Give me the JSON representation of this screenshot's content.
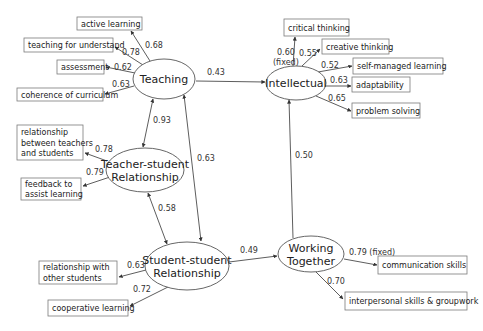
{
  "latent": [
    {
      "id": "teaching",
      "lines": [
        "Teaching"
      ],
      "cx": 164,
      "cy": 79,
      "rx": 31,
      "ry": 20
    },
    {
      "id": "intellectual",
      "lines": [
        "Intellectual"
      ],
      "cx": 296,
      "cy": 83,
      "rx": 30,
      "ry": 17
    },
    {
      "id": "teacher-student",
      "lines": [
        "Teacher-student",
        "Relationship"
      ],
      "cx": 145,
      "cy": 170,
      "rx": 39,
      "ry": 22
    },
    {
      "id": "student-student",
      "lines": [
        "Student-student",
        "Relationship"
      ],
      "cx": 187,
      "cy": 266,
      "rx": 42,
      "ry": 24
    },
    {
      "id": "working-together",
      "lines": [
        "Working",
        "Together"
      ],
      "cx": 311,
      "cy": 254,
      "rx": 33,
      "ry": 18
    }
  ],
  "indicators": [
    {
      "id": "active-learning",
      "lines": [
        "active learning"
      ],
      "x": 77,
      "y": 17,
      "w": 65,
      "h": 13
    },
    {
      "id": "teaching-for-understand",
      "lines": [
        "teaching for understand"
      ],
      "x": 24,
      "y": 38,
      "w": 89,
      "h": 14
    },
    {
      "id": "assessment",
      "lines": [
        "assessment"
      ],
      "x": 57,
      "y": 60,
      "w": 47,
      "h": 14
    },
    {
      "id": "coherence-of-curriculum",
      "lines": [
        "coherence of curriculum"
      ],
      "x": 17,
      "y": 88,
      "w": 86,
      "h": 13
    },
    {
      "id": "relationship-teachers-students",
      "lines": [
        "relationship",
        "between teachers",
        "and students"
      ],
      "x": 17,
      "y": 125,
      "w": 66,
      "h": 35
    },
    {
      "id": "feedback",
      "lines": [
        "feedback to",
        "assist learning"
      ],
      "x": 21,
      "y": 178,
      "w": 60,
      "h": 22
    },
    {
      "id": "relationship-other-students",
      "lines": [
        "relationship with",
        "other students"
      ],
      "x": 39,
      "y": 261,
      "w": 78,
      "h": 23
    },
    {
      "id": "cooperative-learning",
      "lines": [
        "cooperative learning"
      ],
      "x": 48,
      "y": 300,
      "w": 80,
      "h": 16
    },
    {
      "id": "critical-thinking",
      "lines": [
        "critical thinking"
      ],
      "x": 284,
      "y": 19,
      "w": 65,
      "h": 17
    },
    {
      "id": "creative-thinking",
      "lines": [
        "creative thinking"
      ],
      "x": 322,
      "y": 39,
      "w": 67,
      "h": 15
    },
    {
      "id": "self-managed-learning",
      "lines": [
        "self-managed learning"
      ],
      "x": 353,
      "y": 58,
      "w": 90,
      "h": 16
    },
    {
      "id": "adaptability",
      "lines": [
        "adaptability"
      ],
      "x": 352,
      "y": 77,
      "w": 58,
      "h": 15
    },
    {
      "id": "problem-solving",
      "lines": [
        "problem solving"
      ],
      "x": 352,
      "y": 103,
      "w": 68,
      "h": 15
    },
    {
      "id": "communication-skills",
      "lines": [
        "communication skills"
      ],
      "x": 378,
      "y": 256,
      "w": 89,
      "h": 18
    },
    {
      "id": "interpersonal-skills",
      "lines": [
        "interpersonal skills & groupwork"
      ],
      "x": 345,
      "y": 292,
      "w": 122,
      "h": 18
    }
  ],
  "paths": [
    {
      "id": "teaching-active",
      "x1": 150,
      "y1": 61,
      "x2": 131,
      "y2": 31,
      "dir": "end",
      "label": "0.68",
      "lx": 145,
      "ly": 48
    },
    {
      "id": "teaching-understand",
      "x1": 143,
      "y1": 65,
      "x2": 115,
      "y2": 47,
      "dir": "end",
      "label": "0.78",
      "lx": 122,
      "ly": 55
    },
    {
      "id": "teaching-assessment",
      "x1": 135,
      "y1": 73,
      "x2": 106,
      "y2": 67,
      "dir": "end",
      "label": "0.62",
      "lx": 114,
      "ly": 70
    },
    {
      "id": "teaching-coherence",
      "x1": 134,
      "y1": 86,
      "x2": 105,
      "y2": 94,
      "dir": "end",
      "label": "0.63",
      "lx": 112,
      "ly": 87
    },
    {
      "id": "teaching-intellectual",
      "x1": 196,
      "y1": 81,
      "x2": 265,
      "y2": 82,
      "dir": "end",
      "label": "0.43",
      "lx": 207,
      "ly": 75
    },
    {
      "id": "teaching-teacherstudent",
      "x1": 153,
      "y1": 99,
      "x2": 143,
      "y2": 147,
      "dir": "both",
      "label": "0.93",
      "lx": 153,
      "ly": 123
    },
    {
      "id": "teaching-studentstudent",
      "x1": 184,
      "y1": 95,
      "x2": 201,
      "y2": 241,
      "dir": "both",
      "label": "0.63",
      "lx": 197,
      "ly": 161
    },
    {
      "id": "teacherstudent-relationship",
      "x1": 107,
      "y1": 161,
      "x2": 85,
      "y2": 153,
      "dir": "end",
      "label": "0.78",
      "lx": 95,
      "ly": 152
    },
    {
      "id": "teacherstudent-feedback",
      "x1": 110,
      "y1": 177,
      "x2": 83,
      "y2": 186,
      "dir": "end",
      "label": "0.79",
      "lx": 86,
      "ly": 175
    },
    {
      "id": "teacherstudent-studentstudent",
      "x1": 148,
      "y1": 193,
      "x2": 167,
      "y2": 244,
      "dir": "both",
      "label": "0.58",
      "lx": 158,
      "ly": 211
    },
    {
      "id": "studentstudent-other",
      "x1": 146,
      "y1": 270,
      "x2": 119,
      "y2": 277,
      "dir": "end",
      "label": "0.63",
      "lx": 127,
      "ly": 268
    },
    {
      "id": "studentstudent-cooperative",
      "x1": 168,
      "y1": 287,
      "x2": 130,
      "y2": 306,
      "dir": "end",
      "label": "0.72",
      "lx": 133,
      "ly": 292
    },
    {
      "id": "studentstudent-working",
      "x1": 229,
      "y1": 262,
      "x2": 277,
      "y2": 256,
      "dir": "end",
      "label": "0.49",
      "lx": 240,
      "ly": 253
    },
    {
      "id": "working-intellectual",
      "x1": 293,
      "y1": 238,
      "x2": 289,
      "y2": 100,
      "dir": "end",
      "label": "0.50",
      "lx": 295,
      "ly": 158
    },
    {
      "id": "intellectual-critical",
      "x1": 293,
      "y1": 66,
      "x2": 295,
      "y2": 37,
      "dir": "end",
      "label": "0.60",
      "lx": 277,
      "ly": 55
    },
    {
      "id": "intellectual-creative",
      "x1": 302,
      "y1": 66,
      "x2": 320,
      "y2": 49,
      "dir": "end",
      "label": "0.55",
      "lx": 299,
      "ly": 56
    },
    {
      "id": "intellectual-selfmanaged",
      "x1": 318,
      "y1": 72,
      "x2": 352,
      "y2": 66,
      "dir": "end",
      "label": "0.52",
      "lx": 321,
      "ly": 68
    },
    {
      "id": "intellectual-adaptability",
      "x1": 325,
      "y1": 86,
      "x2": 351,
      "y2": 86,
      "dir": "end",
      "label": "0.63",
      "lx": 330,
      "ly": 83
    },
    {
      "id": "intellectual-problem",
      "x1": 316,
      "y1": 96,
      "x2": 351,
      "y2": 111,
      "dir": "end",
      "label": "0.65",
      "lx": 328,
      "ly": 101
    },
    {
      "id": "working-communication",
      "x1": 344,
      "y1": 259,
      "x2": 377,
      "y2": 265,
      "dir": "end",
      "label": "0.79 (fixed)",
      "lx": 349,
      "ly": 255
    },
    {
      "id": "working-interpersonal",
      "x1": 316,
      "y1": 272,
      "x2": 343,
      "y2": 299,
      "dir": "end",
      "label": "0.70",
      "lx": 327,
      "ly": 284
    }
  ],
  "extra_labels": [
    {
      "id": "fixed-note-intellectual",
      "text": "(fixed)",
      "x": 273,
      "y": 65
    }
  ]
}
